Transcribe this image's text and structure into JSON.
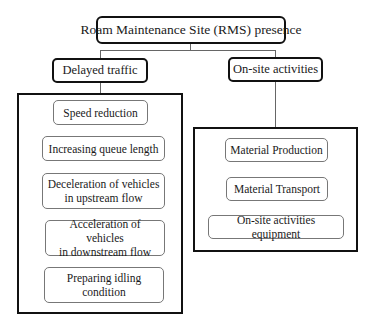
{
  "diagram": {
    "root": {
      "label": "Roam Maintenance Site (RMS) presence"
    },
    "branches": [
      {
        "label": "Delayed traffic",
        "items": [
          {
            "line1": "Speed reduction",
            "line2": ""
          },
          {
            "line1": "Increasing queue length",
            "line2": ""
          },
          {
            "line1": "Deceleration of vehicles",
            "line2": "in upstream flow"
          },
          {
            "line1": "Acceleration of vehicles",
            "line2": "in downstream flow"
          },
          {
            "line1": "Preparing idling",
            "line2": "condition"
          }
        ]
      },
      {
        "label": "On-site activities",
        "items": [
          {
            "line1": "Material Production",
            "line2": ""
          },
          {
            "line1": "Material Transport",
            "line2": ""
          },
          {
            "line1": "On-site activities equipment",
            "line2": ""
          }
        ]
      }
    ]
  }
}
